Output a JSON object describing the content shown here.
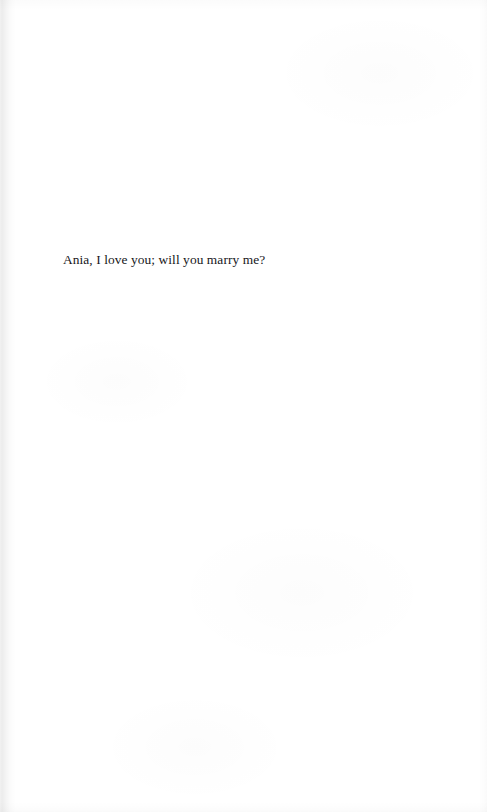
{
  "page": {
    "kind": "scanned-book-page",
    "background_color": "#ffffff",
    "ink_color": "#16161a",
    "width_px": 487,
    "height_px": 812
  },
  "body": {
    "dedication": "Ania, I love you; will you marry me?"
  },
  "artifacts": {
    "gutter_shadow_side": "left",
    "header_text": "",
    "footer_text": "",
    "page_number": ""
  }
}
